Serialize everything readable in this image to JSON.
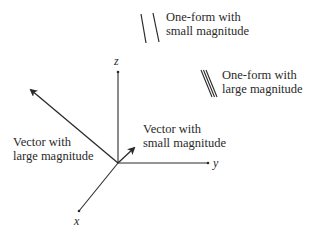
{
  "diagram": {
    "type": "3d-axes-vectors-oneforms",
    "axes": {
      "x": {
        "label": "x"
      },
      "y": {
        "label": "y"
      },
      "z": {
        "label": "z"
      }
    },
    "vectors": [
      {
        "id": "large",
        "label_line1": "Vector with",
        "label_line2": "large magnitude"
      },
      {
        "id": "small",
        "label_line1": "Vector with",
        "label_line2": "small magnitude"
      }
    ],
    "one_forms": [
      {
        "id": "small",
        "label_line1": "One-form with",
        "label_line2": "small magnitude",
        "line_count": 2,
        "spacing": "wide"
      },
      {
        "id": "large",
        "label_line1": "One-form with",
        "label_line2": "large magnitude",
        "line_count": 3,
        "spacing": "narrow"
      }
    ],
    "colors": {
      "stroke": "#2a2a2a",
      "background": "#ffffff"
    }
  }
}
